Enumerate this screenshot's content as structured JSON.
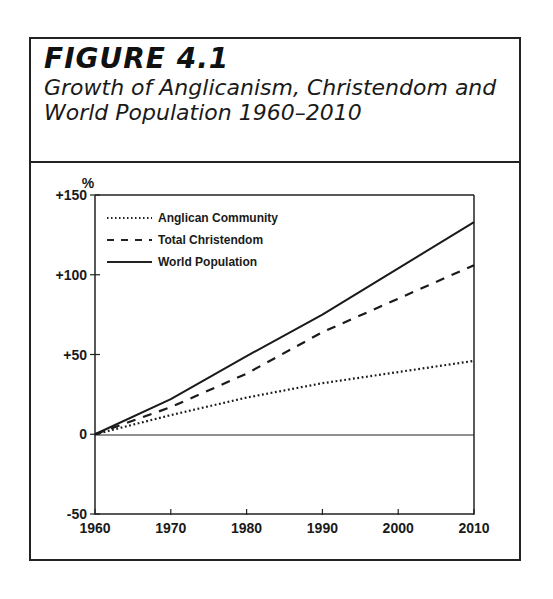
{
  "figure": {
    "label": "FIGURE 4.1",
    "title_line1": "Growth of Anglicanism, Christendom and",
    "title_line2": "World Population 1960–2010"
  },
  "axis": {
    "y_unit": "%",
    "y_ticks": [
      "+150",
      "+100",
      "+50",
      "0",
      "-50"
    ],
    "x_ticks": [
      "1960",
      "1970",
      "1980",
      "1990",
      "2000",
      "2010"
    ]
  },
  "legend": {
    "items": [
      {
        "label": "Anglican Community",
        "style": "dotted"
      },
      {
        "label": "Total Christendom",
        "style": "dashed"
      },
      {
        "label": "World Population",
        "style": "solid"
      }
    ]
  },
  "chart_data": {
    "type": "line",
    "title": "Growth of Anglicanism, Christendom and World Population 1960–2010",
    "subtitle": "FIGURE 4.1",
    "xlabel": "",
    "ylabel": "%",
    "x": [
      1960,
      1970,
      1980,
      1990,
      2000,
      2010
    ],
    "ylim": [
      -50,
      150
    ],
    "xlim": [
      1960,
      2010
    ],
    "yticks": [
      -50,
      0,
      50,
      100,
      150
    ],
    "grid": false,
    "legend_position": "upper left",
    "series": [
      {
        "name": "Anglican Community",
        "style": "dotted",
        "values": [
          0,
          12,
          23,
          32,
          39,
          46
        ]
      },
      {
        "name": "Total Christendom",
        "style": "dashed",
        "values": [
          0,
          17,
          38,
          64,
          85,
          106
        ]
      },
      {
        "name": "World Population",
        "style": "solid",
        "values": [
          0,
          22,
          49,
          75,
          104,
          133
        ]
      }
    ],
    "annotations": [
      "horizontal reference line at 0"
    ]
  }
}
